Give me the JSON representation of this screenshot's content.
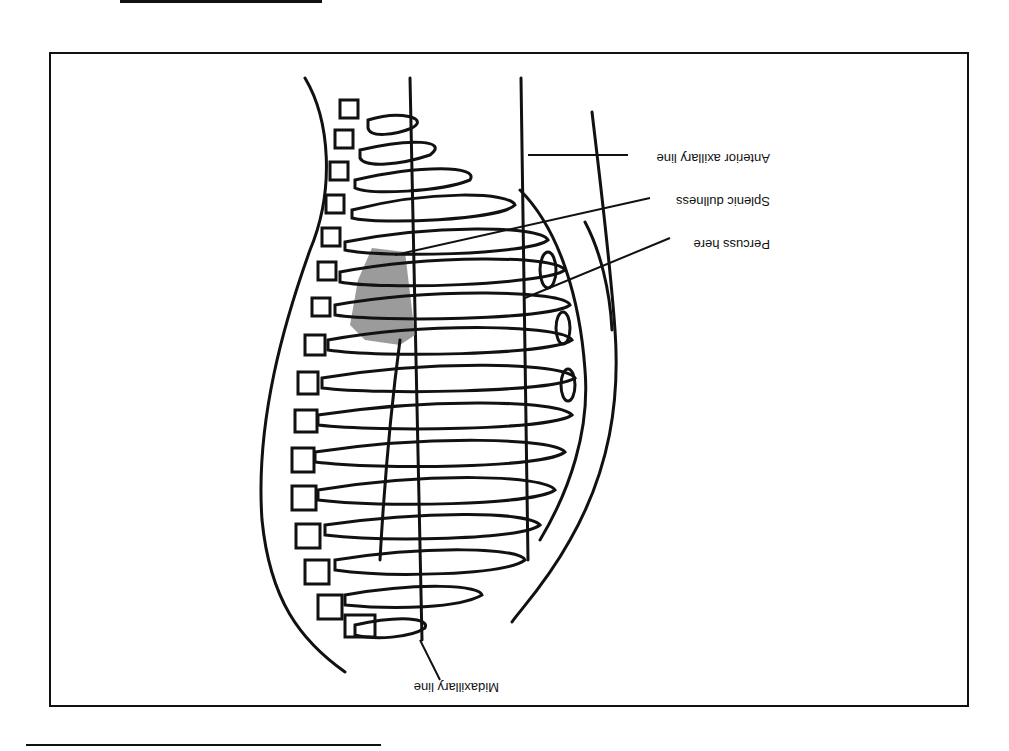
{
  "figure": {
    "orientation": "rotated 180 degrees (scanned upside down)",
    "labels": {
      "anterior_axillary_line": "Anterior axillary line",
      "splenic_dullness": "Splenic dullness",
      "percuss_here": "Percuss here",
      "midaxillary_line": "Midaxillary line"
    },
    "colors": {
      "ink": "#111111",
      "shading": "#8a8a8a",
      "background": "#ffffff"
    }
  }
}
